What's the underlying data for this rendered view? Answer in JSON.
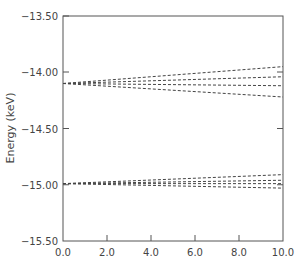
{
  "chart_data": {
    "type": "line",
    "title": "",
    "xlabel": "",
    "ylabel": "Energy (keV)",
    "xlim": [
      0.0,
      10.0
    ],
    "ylim": [
      -15.5,
      -13.5
    ],
    "grid": false,
    "legend": null,
    "x_ticks": [
      "0.0",
      "2.0",
      "4.0",
      "6.0",
      "8.0",
      "10.0"
    ],
    "y_ticks": [
      "-13.50",
      "-14.00",
      "-14.50",
      "-15.00",
      "-15.50"
    ],
    "line_style": "dashed",
    "series": [
      {
        "name": "upper-1",
        "x": [
          0.0,
          10.0
        ],
        "values": [
          -14.1,
          -13.95
        ]
      },
      {
        "name": "upper-2",
        "x": [
          0.0,
          10.0
        ],
        "values": [
          -14.1,
          -14.04
        ]
      },
      {
        "name": "upper-3",
        "x": [
          0.0,
          10.0
        ],
        "values": [
          -14.1,
          -14.12
        ]
      },
      {
        "name": "upper-4",
        "x": [
          0.0,
          10.0
        ],
        "values": [
          -14.1,
          -14.22
        ]
      },
      {
        "name": "lower-1",
        "x": [
          0.0,
          10.0
        ],
        "values": [
          -14.99,
          -14.91
        ]
      },
      {
        "name": "lower-2",
        "x": [
          0.0,
          10.0
        ],
        "values": [
          -14.99,
          -14.96
        ]
      },
      {
        "name": "lower-3",
        "x": [
          0.0,
          10.0
        ],
        "values": [
          -14.99,
          -14.99
        ]
      },
      {
        "name": "lower-4",
        "x": [
          0.0,
          10.0
        ],
        "values": [
          -14.99,
          -15.03
        ]
      }
    ]
  },
  "labels": {
    "ylabel": "Energy (keV)",
    "x_ticks": [
      "0.0",
      "2.0",
      "4.0",
      "6.0",
      "8.0",
      "10.0"
    ],
    "y_ticks": [
      "−13.50",
      "−14.00",
      "−14.50",
      "−15.00",
      "−15.50"
    ]
  }
}
